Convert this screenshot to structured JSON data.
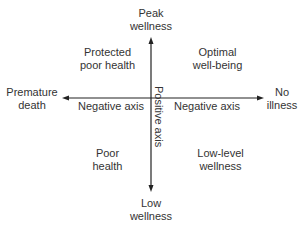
{
  "diagram": {
    "axes": {
      "vertical": {
        "top": [
          "Peak",
          "wellness"
        ],
        "bottom": [
          "Low",
          "wellness"
        ],
        "label": "Positive axis"
      },
      "horizontal": {
        "left": [
          "Premature",
          "death"
        ],
        "right": [
          "No",
          "illness"
        ],
        "left_label": "Negative axis",
        "right_label": "Negative axis"
      }
    },
    "quadrants": {
      "top_left": [
        "Protected",
        "poor health"
      ],
      "top_right": [
        "Optimal",
        "well-being"
      ],
      "bottom_left": [
        "Poor",
        "health"
      ],
      "bottom_right": [
        "Low-level",
        "wellness"
      ]
    },
    "colors": {
      "line": "#222222",
      "text": "#333333"
    }
  }
}
